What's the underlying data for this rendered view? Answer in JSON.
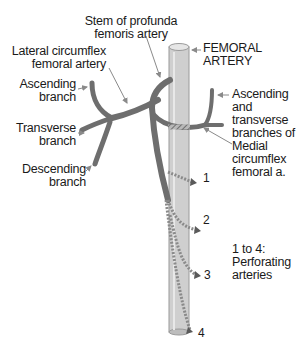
{
  "labels": {
    "stem_profunda": [
      "Stem of profunda",
      "femoris artery"
    ],
    "lateral_circumflex": [
      "Lateral circumflex",
      "femoral artery"
    ],
    "femoral_artery": [
      "FEMORAL",
      "ARTERY"
    ],
    "ascending_branch": [
      "Ascending",
      "branch"
    ],
    "transverse_branch": [
      "Transverse",
      "branch"
    ],
    "descending_branch": [
      "Descending",
      "branch"
    ],
    "medial_circumflex": [
      "Ascending",
      "and",
      "transverse",
      "branches of",
      "Medial",
      "circumflex",
      "femoral a."
    ],
    "perforating_legend": [
      "1 to 4:",
      "Perforating",
      "arteries"
    ]
  },
  "perforating_numbers": [
    "1",
    "2",
    "3",
    "4"
  ],
  "colors": {
    "vessel": "#6e6e6e",
    "femoral_fill": "#cfcfcf",
    "femoral_edge": "#9a9a9a",
    "arrow": "#8a8a8a",
    "text": "#1a1a1a"
  }
}
